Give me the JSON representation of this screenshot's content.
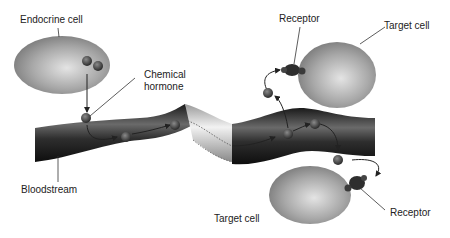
{
  "diagram": {
    "labels": {
      "endocrine_cell": "Endocrine cell",
      "chemical_hormone_line1": "Chemical",
      "chemical_hormone_line2": "hormone",
      "receptor_top": "Receptor",
      "target_cell_top": "Target cell",
      "bloodstream": "Bloodstream",
      "target_cell_bottom": "Target cell",
      "receptor_bottom": "Receptor"
    },
    "colors": {
      "cell_fill": "#9a9a9a",
      "vessel_dark": "#2a2a2a",
      "vessel_light": "#d8d8d8",
      "hormone": "#555555",
      "arrow": "#222222"
    }
  }
}
